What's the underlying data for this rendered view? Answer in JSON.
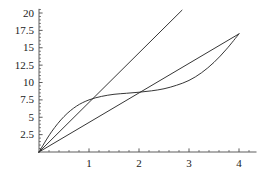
{
  "chart_data": {
    "type": "line",
    "title": "",
    "subtitle": "",
    "xlabel": "",
    "ylabel": "",
    "xlim": [
      0,
      4.35
    ],
    "ylim": [
      0,
      20.6
    ],
    "grid": false,
    "legend": "none",
    "axis_color": "#4a4a4a",
    "curve_color": "#2b2b2b",
    "background": "#ffffff",
    "xticks": [
      1,
      2,
      3,
      4
    ],
    "xtick_labels": [
      "1",
      "2",
      "3",
      "4"
    ],
    "yticks": [
      2.5,
      5,
      7.5,
      10,
      12.5,
      15,
      17.5,
      20
    ],
    "ytick_labels": [
      "2.5",
      "5",
      "7.5",
      "10",
      "12.5",
      "15",
      "17.5",
      "20"
    ],
    "x_minor_tick_step": 0.2,
    "y_minor_tick_step": 0.5,
    "series": [
      {
        "name": "steep-line",
        "type": "line",
        "x": [
          0,
          2.86
        ],
        "values": [
          0,
          20.4
        ],
        "slope": 7.15,
        "note": "straight line from origin exiting top of plot frame"
      },
      {
        "name": "diagonal-line",
        "type": "line",
        "x": [
          0,
          4
        ],
        "values": [
          0,
          17.0
        ],
        "slope": 4.25,
        "note": "straight line from origin to the convergence point at x=4"
      },
      {
        "name": "s-curve",
        "type": "line",
        "x": [
          0,
          0.25,
          0.5,
          0.75,
          1.0,
          1.25,
          1.5,
          1.75,
          2.0,
          2.25,
          2.5,
          2.75,
          3.0,
          3.25,
          3.5,
          3.75,
          4.0
        ],
        "values": [
          0,
          2.9,
          5.1,
          6.6,
          7.5,
          8.0,
          8.3,
          8.45,
          8.6,
          8.8,
          9.1,
          9.6,
          10.3,
          11.4,
          12.9,
          14.8,
          17.0
        ],
        "note": "S-shaped curve from origin, plateau near 8.5 between x=1.5 and x=2.5, then rising to meet the diagonal at (4, 17)"
      }
    ],
    "annotations": [
      {
        "label": "crossing-near-x-1",
        "x": 1.0,
        "y": 7.5
      },
      {
        "label": "crossing-near-x-2",
        "x": 2.0,
        "y": 8.6
      },
      {
        "label": "convergence-point",
        "x": 4.0,
        "y": 17.0
      }
    ]
  }
}
